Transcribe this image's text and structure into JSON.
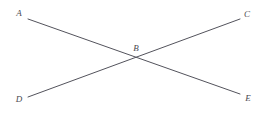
{
  "figure": {
    "kind": "geometry-diagram",
    "width": 264,
    "height": 113,
    "background_color": "#ffffff",
    "line_color": "#53535c",
    "label_color": "#4a4a52",
    "line_width": 1
  },
  "points": [
    {
      "id": "A",
      "label": "A",
      "x": 19,
      "y": 13
    },
    {
      "id": "C",
      "label": "C",
      "x": 247,
      "y": 14
    },
    {
      "id": "B",
      "label": "B",
      "x": 136,
      "y": 48
    },
    {
      "id": "D",
      "label": "D",
      "x": 19,
      "y": 99
    },
    {
      "id": "E",
      "label": "E",
      "x": 248,
      "y": 98
    }
  ],
  "segments": [
    {
      "id": "AE",
      "from": "A",
      "to": "E",
      "x1": 28,
      "y1": 19,
      "x2": 240,
      "y2": 94
    },
    {
      "id": "DC",
      "from": "D",
      "to": "C",
      "x1": 28,
      "y1": 97,
      "x2": 240,
      "y2": 19
    }
  ],
  "intersection": {
    "id": "B",
    "x": 134,
    "y": 58
  }
}
